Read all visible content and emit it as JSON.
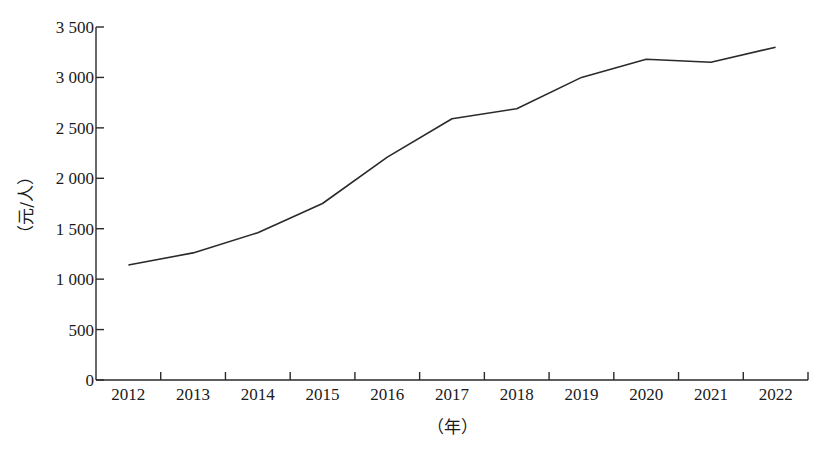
{
  "chart_data": {
    "type": "line",
    "title": "",
    "xlabel": "（年）",
    "ylabel": "（元/人）",
    "categories": [
      "2012",
      "2013",
      "2014",
      "2015",
      "2016",
      "2017",
      "2018",
      "2019",
      "2020",
      "2021",
      "2022"
    ],
    "series": [
      {
        "name": "",
        "values": [
          1140,
          1260,
          1460,
          1750,
          2210,
          2590,
          2690,
          3000,
          3180,
          3150,
          3300
        ]
      }
    ],
    "y_ticks": [
      0,
      500,
      1000,
      1500,
      2000,
      2500,
      3000,
      3500
    ],
    "y_tick_labels": [
      "0",
      "500",
      "1 000",
      "1 500",
      "2 000",
      "2 500",
      "3 000",
      "3 500"
    ],
    "ylim": [
      0,
      3500
    ],
    "grid": false,
    "legend": "none",
    "line_color": "#2a2a2a"
  }
}
